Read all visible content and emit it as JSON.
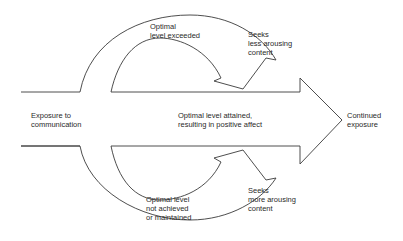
{
  "diagram": {
    "type": "flow-diagram",
    "nodes": {
      "start": {
        "lines": [
          "Exposure to",
          "communication"
        ]
      },
      "center": {
        "lines": [
          "Optimal level attained,",
          "resulting in positive affect"
        ]
      },
      "end": {
        "lines": [
          "Continued",
          "exposure"
        ]
      },
      "top_loop": {
        "lines": [
          "Optimal",
          "level exceeded"
        ]
      },
      "top_action": {
        "lines": [
          "Seeks",
          "less arousing",
          "content"
        ]
      },
      "bottom_loop": {
        "lines": [
          "Optimal level",
          "not achieved",
          "or maintained"
        ]
      },
      "bottom_action": {
        "lines": [
          "Seeks",
          "more arousing",
          "content"
        ]
      }
    },
    "edges": [
      {
        "from": "start",
        "to": "end",
        "label": "center",
        "shape": "block-arrow"
      },
      {
        "from": "start",
        "to": "center",
        "via": "top_loop",
        "action": "top_action",
        "shape": "curved-arrow"
      },
      {
        "from": "start",
        "to": "center",
        "via": "bottom_loop",
        "action": "bottom_action",
        "shape": "curved-arrow"
      }
    ],
    "colors": {
      "stroke": "#3a3a3a",
      "fill": "#ffffff",
      "text": "#2a2a2a"
    }
  }
}
